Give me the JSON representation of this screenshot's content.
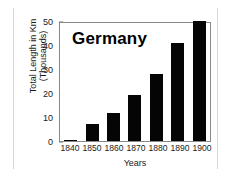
{
  "chart_data": {
    "type": "bar",
    "title": "Germany",
    "xlabel": "Years",
    "ylabel": "Total Length in Km (Thousands)",
    "ylabel_line1": "Total Length in Km",
    "ylabel_line2": "(Thousands)",
    "categories": [
      "1840",
      "1850",
      "1860",
      "1870",
      "1880",
      "1890",
      "1900"
    ],
    "values": [
      0.5,
      7,
      11.5,
      19,
      28,
      41,
      50
    ],
    "ylim": [
      0,
      50
    ],
    "yticks": [
      0,
      10,
      20,
      30,
      40,
      50
    ],
    "ytick_labels": [
      "0",
      "10",
      "20",
      "30",
      "40",
      "50"
    ],
    "grid": false,
    "legend": false,
    "bar_color": "#050505",
    "axis_color": "#8a8a8a",
    "background": "#ffffff"
  }
}
